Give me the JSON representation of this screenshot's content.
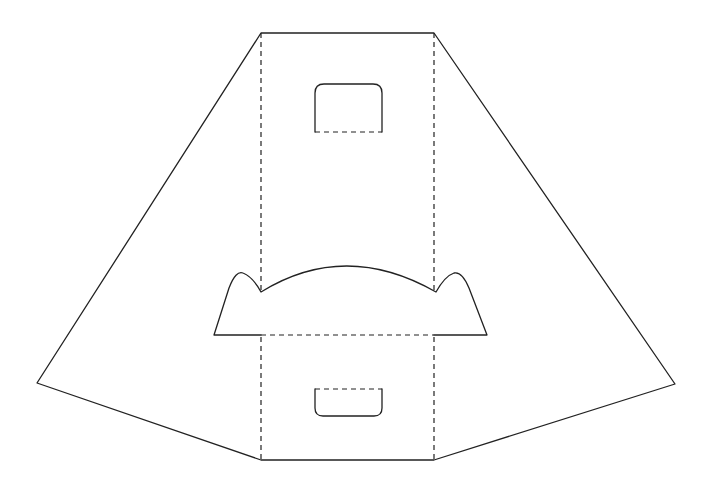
{
  "diagram": {
    "type": "die-cut packaging template",
    "background": "#ffffff",
    "line_color": "#222222",
    "outline": {
      "points": [
        [
          261,
          33
        ],
        [
          434,
          33
        ],
        [
          675,
          384
        ],
        [
          434,
          460
        ],
        [
          261,
          460
        ],
        [
          37,
          383
        ]
      ]
    },
    "fold_lines": [
      {
        "name": "left-vertical-fold",
        "x1": 261,
        "y1": 33,
        "x2": 261,
        "y2": 460
      },
      {
        "name": "right-vertical-fold",
        "x1": 434,
        "y1": 33,
        "x2": 434,
        "y2": 460
      },
      {
        "name": "tab-base-fold",
        "x1": 261,
        "y1": 335,
        "x2": 434,
        "y2": 335
      }
    ],
    "top_window": {
      "x": 315,
      "y": 84,
      "w": 67,
      "h": 48,
      "radius": 9,
      "dashed_side": "bottom"
    },
    "bottom_window": {
      "x": 315,
      "y": 389,
      "w": 67,
      "h": 27,
      "radius": 8,
      "dashed_side": "top"
    },
    "handle_tab": {
      "base_y": 335,
      "left_x": 214,
      "right_x": 487,
      "arch_top_y": 266
    }
  }
}
